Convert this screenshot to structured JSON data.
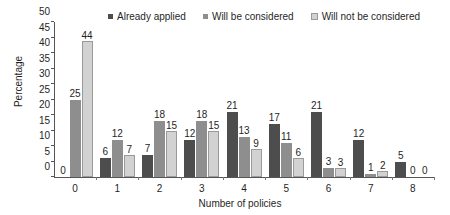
{
  "chart_data": {
    "type": "bar",
    "title": "",
    "xlabel": "Number of policies",
    "ylabel": "Percentage",
    "categories": [
      "0",
      "1",
      "2",
      "3",
      "4",
      "5",
      "6",
      "7",
      "8"
    ],
    "series": [
      {
        "name": "Already applied",
        "color": "#4d4d4d",
        "values": [
          0,
          6,
          7,
          12,
          21,
          17,
          21,
          12,
          5
        ]
      },
      {
        "name": "Will be considered",
        "color": "#8e8e8e",
        "values": [
          25,
          12,
          18,
          18,
          13,
          11,
          3,
          1,
          0
        ]
      },
      {
        "name": "Will not be considered",
        "color": "#d2d2d2",
        "values": [
          44,
          7,
          15,
          15,
          9,
          6,
          3,
          2,
          0
        ]
      }
    ],
    "ylim": [
      0,
      50
    ],
    "yticks": [
      0,
      5,
      10,
      15,
      20,
      25,
      30,
      35,
      40,
      45,
      50
    ],
    "grid": false,
    "legend_position": "top",
    "data_labels": true
  }
}
